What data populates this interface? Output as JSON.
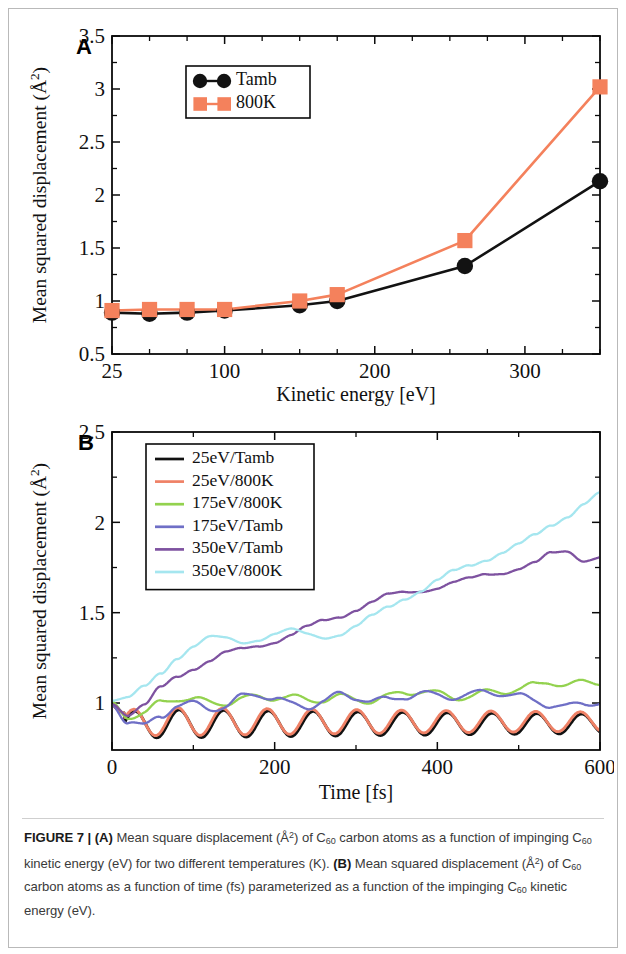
{
  "figure": {
    "label": "FIGURE 7",
    "separator": "|"
  },
  "panelA": {
    "letter": "A",
    "ylabel": "Mean squared displacement (Å",
    "ylabel_sup": "2",
    "ylabel_tail": ")",
    "xlabel": "Kinetic energy [eV]",
    "legend": [
      {
        "label": "Tamb",
        "color": "#121212",
        "marker": "circle"
      },
      {
        "label": "800K",
        "color": "#f4815c",
        "marker": "square"
      }
    ]
  },
  "panelB": {
    "letter": "B",
    "ylabel": "Mean squared displacement (Å",
    "ylabel_sup": "2",
    "ylabel_tail": ")",
    "xlabel": "Time [fs]",
    "legend": [
      {
        "label": "25eV/Tamb",
        "color": "#111111"
      },
      {
        "label": "25eV/800K",
        "color": "#ef8166"
      },
      {
        "label": "175eV/800K",
        "color": "#93d24f"
      },
      {
        "label": "175eV/Tamb",
        "color": "#6f6fc6"
      },
      {
        "label": "350eV/Tamb",
        "color": "#7e52a0"
      },
      {
        "label": "350eV/800K",
        "color": "#a5e6ef"
      }
    ]
  },
  "caption": {
    "part1": "Mean square displacement (Å",
    "part1b": ") of C",
    "c60a": "60",
    "part2": " carbon atoms as a function of impinging C",
    "c60b": "60",
    "part3": " kinetic energy (eV) for two different temperatures (K).",
    "bold_a": "(A)",
    "bold_b": "(B)",
    "part4": "Mean squared displacement (Å",
    "part4b": ") of C",
    "c60c": "60",
    "part5": " carbon atoms as a function of time (fs) parameterized as a function of the impinging C",
    "c60d": "60",
    "part6": " kinetic energy (eV).",
    "sup2": "2"
  },
  "chart_data": [
    {
      "type": "line",
      "panel": "A",
      "title": "",
      "xlabel": "Kinetic energy [eV]",
      "ylabel": "Mean squared displacement (Å^2)",
      "xlim": [
        25,
        350
      ],
      "ylim": [
        0.5,
        3.5
      ],
      "xticks": [
        25,
        100,
        200,
        300
      ],
      "xtick_labels": [
        "25",
        "100",
        "200",
        "300"
      ],
      "xminor": [
        50,
        75,
        125,
        150,
        175,
        225,
        250,
        275,
        325,
        350
      ],
      "yticks": [
        0.5,
        1,
        1.5,
        2,
        2.5,
        3,
        3.5
      ],
      "ytick_labels": [
        "0.5",
        "1",
        "1.5",
        "2",
        "2.5",
        "3",
        "3.5"
      ],
      "yminor": [
        0.75,
        1.25,
        1.75,
        2.25,
        2.75,
        3.25
      ],
      "grid": false,
      "legend_position": "top-left-inset",
      "x": [
        25,
        50,
        75,
        100,
        150,
        175,
        260,
        350
      ],
      "series": [
        {
          "name": "Tamb",
          "color": "#121212",
          "marker": "circle",
          "values": [
            0.89,
            0.88,
            0.89,
            0.91,
            0.96,
            1.0,
            1.33,
            2.13
          ]
        },
        {
          "name": "800K",
          "color": "#f4815c",
          "marker": "square",
          "values": [
            0.91,
            0.92,
            0.92,
            0.92,
            1.0,
            1.06,
            1.57,
            3.02
          ]
        }
      ]
    },
    {
      "type": "line",
      "panel": "B",
      "title": "",
      "xlabel": "Time [fs]",
      "ylabel": "Mean squared displacement (Å^2)",
      "xlim": [
        0,
        600
      ],
      "ylim": [
        0.74,
        2.5
      ],
      "xticks": [
        0,
        200,
        400,
        600
      ],
      "xtick_labels": [
        "0",
        "200",
        "400",
        "600"
      ],
      "xminor": [
        100,
        300,
        500
      ],
      "yticks": [
        1,
        1.5,
        2,
        2.5
      ],
      "ytick_labels": [
        "1",
        "1.5",
        "2",
        "2.5"
      ],
      "yminor": [
        1.25,
        1.75,
        2.25
      ],
      "grid": false,
      "legend_position": "top-left-inset",
      "x": [
        0,
        20,
        40,
        60,
        80,
        100,
        120,
        140,
        160,
        180,
        200,
        220,
        240,
        260,
        280,
        300,
        320,
        340,
        360,
        380,
        400,
        420,
        440,
        460,
        480,
        500,
        520,
        540,
        560,
        580,
        600
      ],
      "series": [
        {
          "name": "25eV/Tamb",
          "color": "#111111",
          "values": [
            1.0,
            0.88,
            0.81,
            0.86,
            0.94,
            0.88,
            0.81,
            0.87,
            0.95,
            0.88,
            0.81,
            0.87,
            0.95,
            0.89,
            0.82,
            0.87,
            0.94,
            0.89,
            0.83,
            0.87,
            0.94,
            0.89,
            0.84,
            0.88,
            0.93,
            0.89,
            0.85,
            0.88,
            0.92,
            0.89,
            0.87
          ]
        },
        {
          "name": "25eV/800K",
          "color": "#ef8166",
          "values": [
            0.99,
            0.89,
            0.81,
            0.86,
            0.94,
            0.89,
            0.81,
            0.87,
            0.95,
            0.89,
            0.81,
            0.87,
            0.95,
            0.9,
            0.82,
            0.87,
            0.94,
            0.9,
            0.83,
            0.87,
            0.94,
            0.9,
            0.84,
            0.88,
            0.93,
            0.9,
            0.85,
            0.88,
            0.92,
            0.9,
            0.88
          ]
        },
        {
          "name": "175eV/800K",
          "color": "#93d24f",
          "values": [
            1.0,
            0.94,
            0.95,
            1.0,
            1.02,
            1.01,
            1.0,
            1.01,
            1.03,
            1.04,
            1.03,
            1.02,
            1.01,
            1.02,
            1.04,
            1.03,
            1.02,
            1.03,
            1.05,
            1.06,
            1.05,
            1.04,
            1.05,
            1.06,
            1.06,
            1.07,
            1.09,
            1.12,
            1.11,
            1.12,
            1.12
          ]
        },
        {
          "name": "175eV/Tamb",
          "color": "#6f6fc6",
          "values": [
            1.0,
            0.9,
            0.86,
            0.92,
            0.99,
            1.0,
            0.98,
            0.99,
            1.03,
            1.04,
            1.02,
            0.99,
            0.99,
            1.02,
            1.05,
            1.03,
            1.0,
            1.01,
            1.04,
            1.06,
            1.05,
            1.04,
            1.04,
            1.05,
            1.05,
            1.04,
            1.02,
            1.0,
            0.98,
            0.99,
            1.0
          ]
        },
        {
          "name": "350eV/Tamb",
          "color": "#7e52a0",
          "values": [
            1.0,
            0.93,
            0.98,
            1.08,
            1.15,
            1.2,
            1.24,
            1.28,
            1.3,
            1.32,
            1.34,
            1.37,
            1.41,
            1.45,
            1.48,
            1.52,
            1.56,
            1.6,
            1.62,
            1.63,
            1.64,
            1.66,
            1.68,
            1.71,
            1.72,
            1.74,
            1.77,
            1.83,
            1.85,
            1.8,
            1.81
          ]
        },
        {
          "name": "350eV/800K",
          "color": "#a5e6ef",
          "values": [
            1.02,
            1.03,
            1.09,
            1.17,
            1.26,
            1.32,
            1.36,
            1.35,
            1.33,
            1.35,
            1.38,
            1.4,
            1.38,
            1.37,
            1.39,
            1.43,
            1.48,
            1.53,
            1.58,
            1.62,
            1.67,
            1.72,
            1.76,
            1.8,
            1.84,
            1.88,
            1.93,
            1.99,
            2.04,
            2.1,
            2.15
          ]
        }
      ]
    }
  ]
}
